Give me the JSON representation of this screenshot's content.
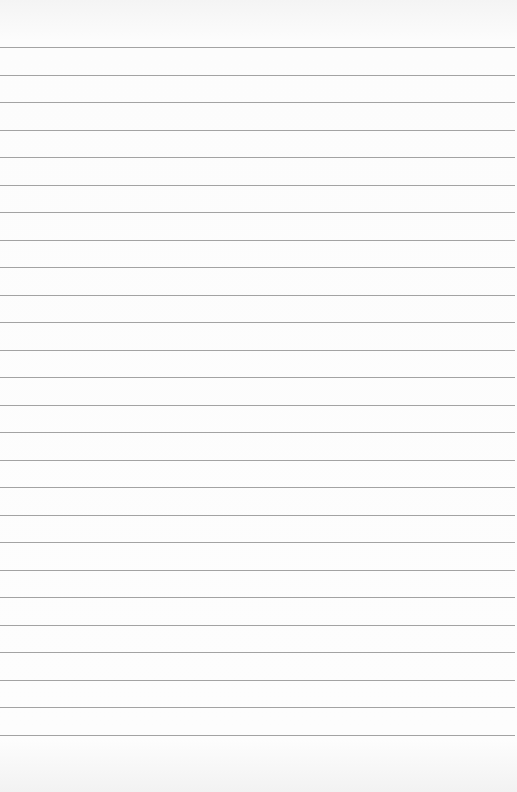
{
  "page": {
    "type": "lined-paper",
    "line_count": 26,
    "line_color": "#a3a3a3",
    "paper_color": "#fbfbfb"
  }
}
